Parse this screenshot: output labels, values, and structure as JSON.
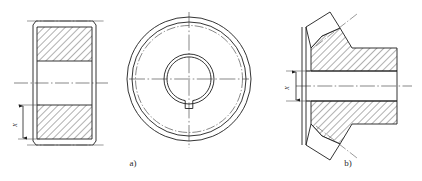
{
  "figure": {
    "background_color": "#ffffff",
    "line_color": "#1d1d1d",
    "centerline_color": "#555555",
    "hatch_color": "#1d1d1d"
  },
  "captions": {
    "left": "a)",
    "right": "b)"
  },
  "dimensions": {
    "left_label": "x",
    "right_label": "x"
  },
  "views": {
    "left_section": {
      "name": "cylindrical-gear-section-view",
      "description": "Sectioned front view of cylindrical gear hub with hatched rim top and bottom, plain bore in middle, chamfered corners",
      "centerline": true,
      "hatching": "45-degree"
    },
    "left_circle": {
      "name": "cylindrical-gear-end-view",
      "description": "End view showing outer tip circle, root circle, dash-dot pitch circle, bore circle and keyway notch at bottom",
      "circles": [
        {
          "name": "tip-circle",
          "style": "solid"
        },
        {
          "name": "root-circle",
          "style": "solid"
        },
        {
          "name": "pitch-circle",
          "style": "dash-dot"
        },
        {
          "name": "bore-outer-circle",
          "style": "solid"
        },
        {
          "name": "bore-inner-circle",
          "style": "solid"
        }
      ],
      "keyway": {
        "position": "bottom",
        "shape": "rectangular-notch"
      }
    },
    "right_section": {
      "name": "bevel-gear-section-view",
      "description": "Sectioned view of bevel gear with angled tooth cones top and bottom, hatched body, stepped hub to the right, plain bore through centre",
      "centerline": true,
      "hatching": "45-degree"
    }
  }
}
